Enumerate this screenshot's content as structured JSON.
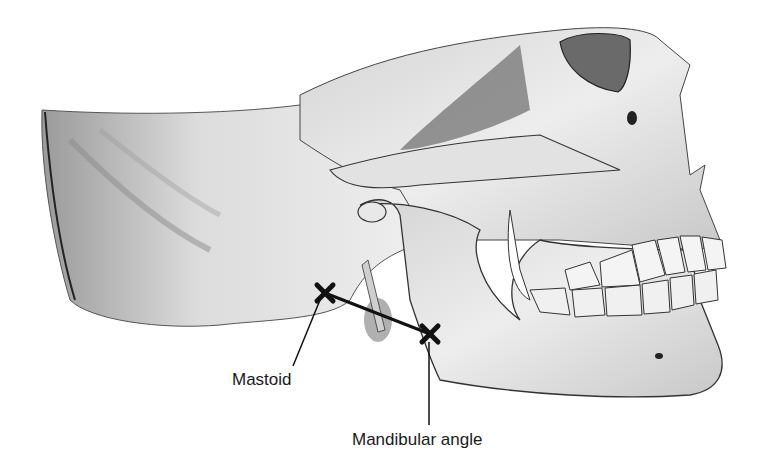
{
  "figure": {
    "colors": {
      "background": "#ffffff",
      "bone_light": "#e6e6e6",
      "bone_mid": "#bdbdbd",
      "bone_dark": "#6e6e6e",
      "outline": "#2a2a2a",
      "marker": "#111111"
    },
    "markers": [
      {
        "id": "mastoid",
        "x": 325,
        "y": 293
      },
      {
        "id": "mandibular_angle",
        "x": 430,
        "y": 334
      }
    ],
    "labels": {
      "mastoid": "Mastoid",
      "mandibular_angle": "Mandibular angle"
    }
  }
}
